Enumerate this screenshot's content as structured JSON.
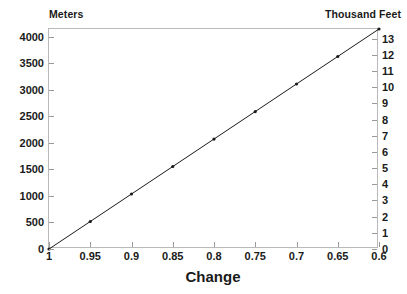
{
  "chart_data": {
    "type": "line",
    "title": "",
    "xlabel": "Change",
    "ylabel": "Meters",
    "y2label": "Thousand Feet",
    "grid": false,
    "legend": "none",
    "xlim": [
      1.0,
      0.6
    ],
    "x_reversed": true,
    "ylim": [
      0,
      4145
    ],
    "y2lim": [
      0,
      13.6
    ],
    "x_ticks": [
      1,
      0.95,
      0.9,
      0.85,
      0.8,
      0.75,
      0.7,
      0.65,
      0.6
    ],
    "x_tick_labels": [
      "1",
      "0.95",
      "0.9",
      "0.85",
      "0.8",
      "0.75",
      "0.7",
      "0.65",
      "0.6"
    ],
    "y_ticks": [
      0,
      500,
      1000,
      1500,
      2000,
      2500,
      3000,
      3500,
      4000
    ],
    "y_tick_labels": [
      "0",
      "500",
      "1000",
      "1500",
      "2000",
      "2500",
      "3000",
      "3500",
      "4000"
    ],
    "y2_ticks": [
      0,
      1,
      2,
      3,
      4,
      5,
      6,
      7,
      8,
      9,
      10,
      11,
      12,
      13
    ],
    "y2_tick_labels": [
      "0",
      "1",
      "2",
      "3",
      "4",
      "5",
      "6",
      "7",
      "8",
      "9",
      "10",
      "11",
      "12",
      "13"
    ],
    "series": [
      {
        "name": "altitude",
        "color": "#1a1a1a",
        "marker": "dot",
        "x": [
          1.0,
          0.95,
          0.9,
          0.85,
          0.8,
          0.75,
          0.7,
          0.65,
          0.6
        ],
        "y": [
          0,
          518,
          1036,
          1554,
          2072,
          2590,
          3109,
          3627,
          4145
        ],
        "y2": [
          0.0,
          1.7,
          3.4,
          5.1,
          6.8,
          8.5,
          10.2,
          11.9,
          13.6
        ]
      }
    ]
  },
  "labels": {
    "left_unit_caption": "Meters",
    "right_unit_caption": "Thousand Feet",
    "x_axis_title": "Change"
  },
  "colors": {
    "line": "#1a1a1a",
    "marker": "#1a1a1a",
    "frame": "#b9b9b9",
    "tick": "#9a9a9a",
    "text": "#1a1a1a",
    "background": "#ffffff"
  }
}
